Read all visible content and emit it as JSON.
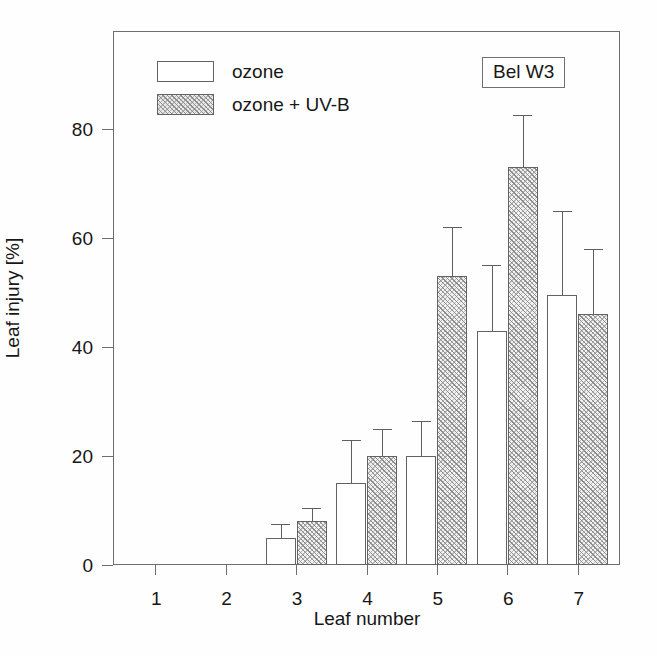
{
  "chart_data": {
    "type": "bar",
    "title": "",
    "subtitle": "",
    "xlabel": "Leaf number",
    "ylabel": "Leaf injury [%]",
    "categories": [
      "1",
      "2",
      "3",
      "4",
      "5",
      "6",
      "7"
    ],
    "xtick_labels": [
      "1",
      "2",
      "3",
      "4",
      "5",
      "6",
      "7"
    ],
    "ytick_labels": [
      "0",
      "20",
      "40",
      "60",
      "80"
    ],
    "yticks": [
      0,
      20,
      40,
      60,
      80
    ],
    "ylim": [
      0,
      98
    ],
    "xlim": [
      0.4,
      7.6
    ],
    "grid": false,
    "legend_position": "upper-left",
    "annotation": "Bel W3",
    "series": [
      {
        "name": "ozone",
        "fill": "open",
        "values": [
          0,
          0,
          5,
          15,
          20,
          43,
          49.5
        ],
        "errors": [
          0,
          0,
          2.5,
          8,
          6.5,
          12,
          15.5
        ]
      },
      {
        "name": "ozone + UV-B",
        "fill": "hatched",
        "values": [
          0,
          0,
          8,
          20,
          53,
          73,
          46
        ],
        "errors": [
          0,
          0,
          2.5,
          5,
          9,
          9.5,
          12
        ]
      }
    ]
  },
  "legend": {
    "items": [
      {
        "label": "ozone",
        "fill": "open"
      },
      {
        "label": "ozone + UV-B",
        "fill": "hatched"
      }
    ]
  },
  "axes": {
    "y_title": "Leaf injury [%]",
    "x_title": "Leaf number"
  },
  "colors": {
    "frame": "#6d6d6d",
    "bar_edge": "#636363",
    "hatch": "#8c8c8c",
    "text": "#171717",
    "background": "#ffffff"
  }
}
